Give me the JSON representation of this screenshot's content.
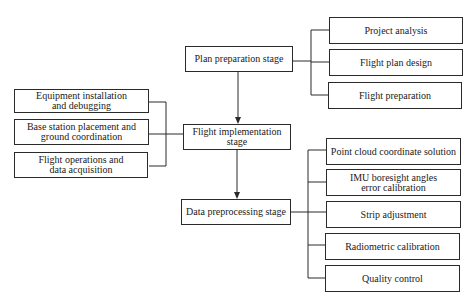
{
  "diagram": {
    "stages": [
      {
        "id": "plan",
        "label": "Plan preparation stage"
      },
      {
        "id": "flight",
        "label": "Flight implementation stage"
      },
      {
        "id": "data",
        "label": "Data preprocessing stage"
      }
    ],
    "plan_steps": [
      {
        "label": "Project analysis"
      },
      {
        "label": "Flight plan design"
      },
      {
        "label": "Flight preparation"
      }
    ],
    "flight_steps": [
      {
        "label": "Equipment installation and debugging"
      },
      {
        "label": "Base station placement and ground coordination"
      },
      {
        "label": "Flight operations and data acquisition"
      }
    ],
    "data_steps": [
      {
        "label": "Point cloud coordinate solution"
      },
      {
        "label": "IMU boresight angles error calibration"
      },
      {
        "label": "Strip adjustment"
      },
      {
        "label": "Radiometric calibration"
      },
      {
        "label": "Quality control"
      }
    ],
    "colors": {
      "line": "#2a2a2a",
      "background": "#ffffff"
    }
  }
}
